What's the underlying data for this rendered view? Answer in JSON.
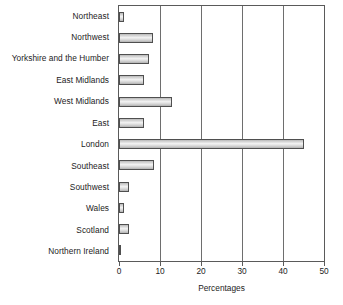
{
  "chart_data": {
    "type": "bar",
    "orientation": "horizontal",
    "title": "",
    "xlabel": "Percentages",
    "ylabel": "",
    "xlim": [
      0,
      50
    ],
    "xticks": [
      0,
      10,
      20,
      30,
      40,
      50
    ],
    "grid": true,
    "legend": null,
    "categories": [
      "Northeast",
      "Northwest",
      "Yorkshire and the Humber",
      "East Midlands",
      "West Midlands",
      "East",
      "London",
      "Southeast",
      "Southwest",
      "Wales",
      "Scotland",
      "Northern Ireland"
    ],
    "values": [
      1.2,
      8.2,
      7.2,
      6.0,
      13.0,
      6.0,
      45.0,
      8.5,
      2.5,
      1.3,
      2.4,
      0.6
    ],
    "bar_color": "#d9d9d9",
    "bar_border_color": "#4f4f4f",
    "axis_color": "#5a5a5a",
    "gridline_color": "#6e6e6e"
  },
  "axis": {
    "tick_labels": [
      "0",
      "10",
      "20",
      "30",
      "40",
      "50"
    ],
    "title": "Percentages"
  }
}
